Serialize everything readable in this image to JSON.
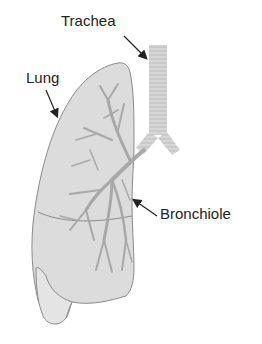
{
  "labels": {
    "trachea": "Trachea",
    "lung": "Lung",
    "bronchiole": "Bronchiole"
  },
  "colors": {
    "background": "#ffffff",
    "lung_fill": "#dcdcdc",
    "lung_outline": "#8a8a8a",
    "bronchi": "#a8a8a8",
    "trachea_fill": "#d2d2d2",
    "label_text": "#222222",
    "arrow": "#222222"
  }
}
